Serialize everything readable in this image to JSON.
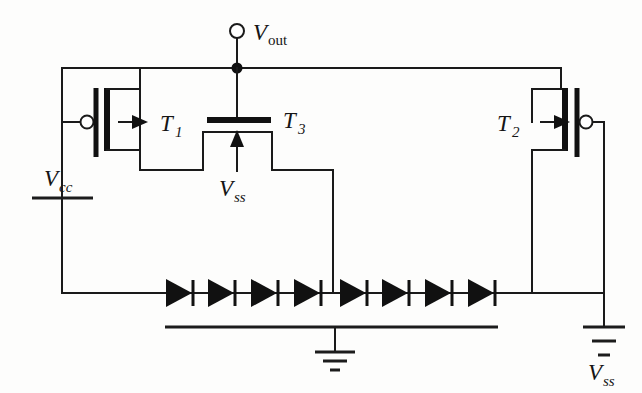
{
  "figure": {
    "kind": "circuit-schematic",
    "background_color": "#fdfdfc",
    "line_color": "#1a1a1a"
  },
  "labels": {
    "t1": {
      "base": "T",
      "sub": "1"
    },
    "t2": {
      "base": "T",
      "sub": "2"
    },
    "t3": {
      "base": "T",
      "sub": "3"
    },
    "vout": {
      "base": "V",
      "sub": "out"
    },
    "vcc": {
      "base": "V",
      "sub": "cc"
    },
    "vss_mid": {
      "base": "V",
      "sub": "ss"
    },
    "vss_right": {
      "base": "V",
      "sub": "ss"
    }
  },
  "terminals": {
    "vout_terminal": "open-circle-terminal",
    "ground_symbol": "earth-ground",
    "vcc_source": "battery-rail",
    "vss_source": "battery-rail"
  },
  "components": {
    "transistors": [
      {
        "name": "T1",
        "label": "T1",
        "orientation": "horizontal",
        "gate_bubble": "left",
        "arrow_direction": "right"
      },
      {
        "name": "T2",
        "label": "T2",
        "orientation": "horizontal",
        "gate_bubble": "right",
        "arrow_direction": "right"
      },
      {
        "name": "T3",
        "label": "T3",
        "orientation": "vertical",
        "gate_bubble": "none",
        "arrow_direction": "up"
      }
    ],
    "diode_chain": {
      "count": 8,
      "orientation": "horizontal",
      "direction": "anode-left-cathode-right",
      "x_positions": [
        172,
        213,
        256,
        299,
        345,
        387,
        430,
        473
      ],
      "y": 293
    }
  },
  "nets": {
    "output_node": "Vout",
    "supply_positive": "Vcc",
    "supply_negative": "Vss",
    "reference": "ground"
  }
}
